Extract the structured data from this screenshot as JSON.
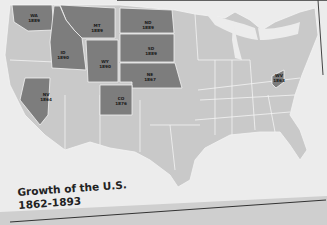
{
  "map": {
    "title": "Growth of the U.S.",
    "subtitle": "1862-1893",
    "colors": {
      "highlight_state": "#7d7d7d",
      "other_state": "#c9c9c9",
      "water_background": "#ededed",
      "border": "#f4f4f4",
      "label_text": "#1a1a1a"
    },
    "states": [
      {
        "abbr": "WA",
        "year": "1889"
      },
      {
        "abbr": "MT",
        "year": "1889"
      },
      {
        "abbr": "ND",
        "year": "1889"
      },
      {
        "abbr": "ID",
        "year": "1890"
      },
      {
        "abbr": "SD",
        "year": "1889"
      },
      {
        "abbr": "WY",
        "year": "1890"
      },
      {
        "abbr": "NE",
        "year": "1867"
      },
      {
        "abbr": "NV",
        "year": "1864"
      },
      {
        "abbr": "CO",
        "year": "1876"
      },
      {
        "abbr": "WV",
        "year": "1863"
      }
    ]
  }
}
